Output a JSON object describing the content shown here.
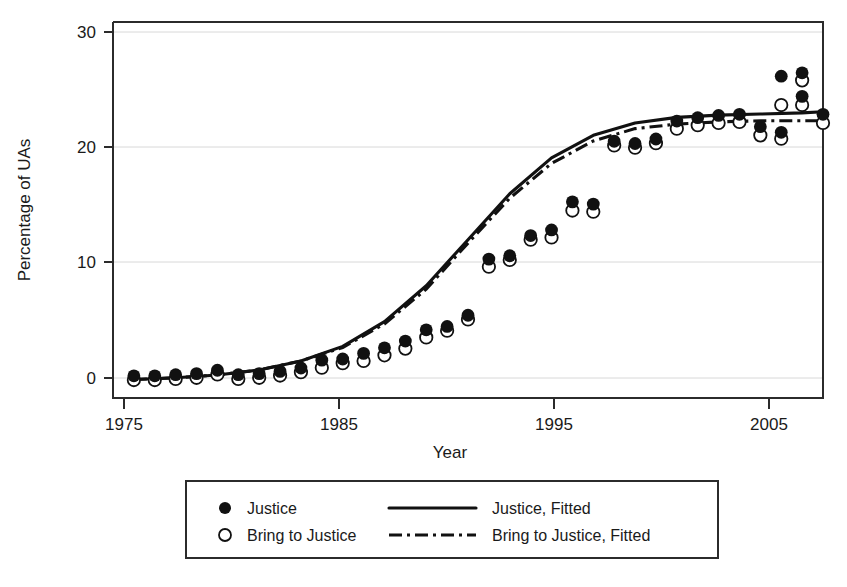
{
  "chart_data": {
    "type": "scatter",
    "title": "",
    "xlabel": "Year",
    "ylabel": "Percentage of UAs",
    "xlim": [
      1974,
      2008
    ],
    "ylim": [
      -1.5,
      32
    ],
    "xticks": [
      1975,
      1985,
      1995,
      2005
    ],
    "yticks": [
      0,
      10,
      20,
      30
    ],
    "grid": "horizontal-faint",
    "legend_position": "below-plot-outside",
    "x": [
      1975,
      1976,
      1977,
      1978,
      1979,
      1980,
      1981,
      1982,
      1983,
      1984,
      1985,
      1986,
      1987,
      1988,
      1989,
      1990,
      1991,
      1992,
      1993,
      1994,
      1995,
      1996,
      1997,
      1998,
      1999,
      2000,
      2001,
      2002,
      2003,
      2004,
      2005,
      2006,
      2007
    ],
    "series": [
      {
        "name": "Justice",
        "marker": "filled-circle",
        "values": [
          0.1,
          0.1,
          0.2,
          0.3,
          0.6,
          0.2,
          0.3,
          0.5,
          0.8,
          1.5,
          1.6,
          2.1,
          2.6,
          3.2,
          4.2,
          4.5,
          5.5,
          10.5,
          10.8,
          12.6,
          13.1,
          15.6,
          15.4,
          21.0,
          20.8,
          21.2,
          22.8,
          23.1,
          23.3,
          23.4,
          22.3,
          21.8,
          25.0
        ]
      },
      {
        "name": "Bring to Justice",
        "marker": "open-circle",
        "values": [
          0.1,
          0.1,
          0.2,
          0.3,
          0.6,
          0.2,
          0.3,
          0.5,
          0.8,
          1.2,
          1.6,
          1.8,
          2.3,
          2.9,
          3.9,
          4.5,
          5.5,
          10.2,
          10.8,
          12.6,
          12.8,
          15.2,
          15.1,
          21.0,
          20.8,
          21.2,
          22.5,
          22.8,
          23.0,
          23.1,
          21.9,
          21.6,
          24.6
        ]
      }
    ],
    "extra_points": {
      "note": "Final years beyond 2005 tick",
      "x": [
        2006,
        2007,
        2008
      ],
      "justice": [
        26.8,
        27.1,
        23.4
      ],
      "bring_to_justice": [
        24.6,
        26.8,
        23.0
      ]
    },
    "fitted": [
      {
        "name": "Justice, Fitted",
        "style": "solid",
        "x": [
          1975,
          1977,
          1979,
          1981,
          1983,
          1985,
          1987,
          1989,
          1991,
          1993,
          1995,
          1997,
          1999,
          2001,
          2003,
          2005,
          2007,
          2008
        ],
        "values": [
          0.15,
          0.3,
          0.55,
          1.0,
          1.8,
          3.1,
          5.3,
          8.5,
          12.6,
          16.7,
          19.9,
          21.9,
          23.0,
          23.5,
          23.7,
          23.8,
          23.9,
          24.0
        ]
      },
      {
        "name": "Bring to Justice, Fitted",
        "style": "dash-dot",
        "x": [
          1975,
          1977,
          1979,
          1981,
          1983,
          1985,
          1987,
          1989,
          1991,
          1993,
          1995,
          1997,
          1999,
          2001,
          2003,
          2005,
          2007,
          2008
        ],
        "values": [
          0.15,
          0.3,
          0.55,
          1.0,
          1.8,
          3.0,
          5.1,
          8.2,
          12.3,
          16.3,
          19.4,
          21.4,
          22.5,
          22.9,
          23.1,
          23.2,
          23.2,
          23.2
        ]
      }
    ]
  },
  "axes": {
    "y_label": "Percentage of UAs",
    "x_label": "Year",
    "y_ticks": [
      "0",
      "10",
      "20",
      "30"
    ],
    "x_ticks": [
      "1975",
      "1985",
      "1995",
      "2005"
    ]
  },
  "legend": {
    "entries": [
      {
        "label": "Justice",
        "marker": "filled-circle"
      },
      {
        "label": "Bring to Justice",
        "marker": "open-circle"
      },
      {
        "label": "Justice, Fitted",
        "marker": "solid-line"
      },
      {
        "label": "Bring to Justice, Fitted",
        "marker": "dashdot-line"
      }
    ]
  },
  "colors": {
    "foreground": "#111111",
    "frame": "#2b2b2b",
    "grid": "#d8d8d8",
    "background": "#ffffff"
  }
}
